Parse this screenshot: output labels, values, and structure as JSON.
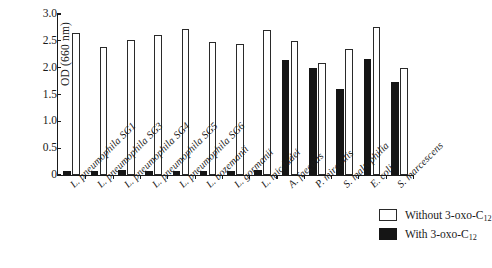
{
  "chart_data": {
    "type": "bar",
    "title": "",
    "xlabel": "",
    "ylabel": "OD (660 nm)",
    "ylim": [
      0,
      3.0
    ],
    "yticks": [
      "0",
      "0.5",
      "1.0",
      "1.5",
      "2.0",
      "2.5",
      "3.0"
    ],
    "ytick_values": [
      0,
      0.5,
      1.0,
      1.5,
      2.0,
      2.5,
      3.0
    ],
    "grid": false,
    "legend_position": "bottom-right",
    "categories": [
      "L. pneumophila SG1",
      "L. pneumophila SG3",
      "L. pneumophila SG4",
      "L. pneumophila SG5",
      "L. pneumophila SG6",
      "L. bozemanii",
      "L. gormanii",
      "L. micdadei",
      "A. faecalis",
      "P. mirabilis",
      "S. maltophilia",
      "E. coli",
      "S. marcescens"
    ],
    "series": [
      {
        "name": "With 3-oxo-C12",
        "legend_label": "With 3-oxo-C",
        "legend_sub": "12",
        "color": "#151515",
        "values": [
          0.07,
          0.08,
          0.09,
          0.07,
          0.07,
          0.08,
          0.08,
          0.09,
          2.15,
          2.0,
          1.61,
          2.16,
          1.74
        ]
      },
      {
        "name": "Without 3-oxo-C12",
        "legend_label": "Without 3-oxo-C",
        "legend_sub": "12",
        "color": "#ffffff",
        "values": [
          2.65,
          2.38,
          2.52,
          2.61,
          2.73,
          2.47,
          2.44,
          2.71,
          2.49,
          2.08,
          2.34,
          2.76,
          2.0
        ]
      }
    ]
  },
  "legend": {
    "rows": [
      {
        "swatch": "white",
        "label": "Without 3-oxo-C",
        "sub": "12"
      },
      {
        "swatch": "black",
        "label": "With 3-oxo-C",
        "sub": "12"
      }
    ]
  },
  "axes": {
    "y_title": "OD (660 nm)"
  }
}
